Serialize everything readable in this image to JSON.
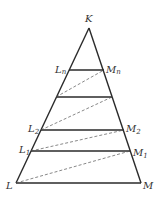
{
  "diagram": {
    "colors": {
      "stroke": "#2a2a2a",
      "dashed": "#555555",
      "text": "#333333"
    },
    "points": {
      "K": {
        "x": 89,
        "y": 28
      },
      "L": {
        "x": 16,
        "y": 183
      },
      "M": {
        "x": 141,
        "y": 183
      },
      "L1": {
        "x": 31,
        "y": 151
      },
      "M1": {
        "x": 130,
        "y": 151
      },
      "L2": {
        "x": 41,
        "y": 130
      },
      "M2": {
        "x": 124,
        "y": 130
      },
      "L3": {
        "x": 56,
        "y": 97
      },
      "M3": {
        "x": 112,
        "y": 97
      },
      "Ln": {
        "x": 69,
        "y": 70
      },
      "Mn": {
        "x": 104,
        "y": 70
      }
    },
    "labels": {
      "K": "K",
      "L": "L",
      "M": "M",
      "L1_base": "L",
      "L1_sub": "1",
      "M1_base": "M",
      "M1_sub": "1",
      "L2_base": "L",
      "L2_sub": "2",
      "M2_base": "M",
      "M2_sub": "2",
      "Ln_base": "L",
      "Ln_sub": "n",
      "Mn_base": "M",
      "Mn_sub": "n"
    },
    "solid_segments": [
      [
        "L",
        "M"
      ],
      [
        "L1",
        "M1"
      ],
      [
        "L2",
        "M2"
      ],
      [
        "L3",
        "M3"
      ],
      [
        "Ln",
        "Mn"
      ],
      [
        "K",
        "L"
      ],
      [
        "K",
        "M"
      ]
    ],
    "dashed_segments": [
      [
        "L",
        "M1"
      ],
      [
        "L1",
        "M2"
      ],
      [
        "L2",
        "M3"
      ],
      [
        "L3",
        "Mn"
      ]
    ]
  }
}
